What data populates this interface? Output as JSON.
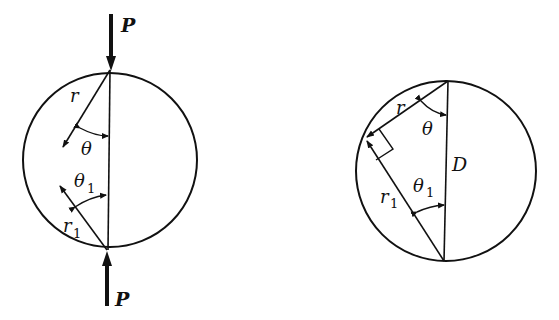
{
  "figure": {
    "left_panel": {
      "description": "Disk under diametral compression by two opposing forces P",
      "labels": {
        "force_top": "P",
        "force_bottom": "P",
        "radius_top": "r",
        "angle_top": "θ",
        "angle_bottom": "θ",
        "angle_bottom_sub": "1",
        "radius_bottom": "r",
        "radius_bottom_sub": "1"
      }
    },
    "right_panel": {
      "description": "Inscribed right triangle on diameter D showing r and r1 perpendicular",
      "labels": {
        "radius_top": "r",
        "angle_top": "θ",
        "diameter": "D",
        "angle_bottom": "θ",
        "angle_bottom_sub": "1",
        "radius_bottom": "r",
        "radius_bottom_sub": "1"
      }
    },
    "colors": {
      "stroke": "#111111",
      "background": "#ffffff"
    }
  }
}
